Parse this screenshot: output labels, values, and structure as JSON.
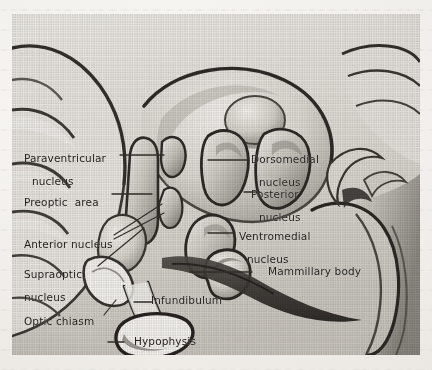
{
  "figure": {
    "kind": "anatomical-illustration",
    "medium": "grayscale halftone print scan"
  },
  "labels": {
    "paraventricular_nucleus": {
      "line1": "Paraventricular",
      "line2": "nucleus"
    },
    "preoptic_area": {
      "line1": "Preoptic  area"
    },
    "anterior_nucleus": {
      "line1": "Anterior nucleus"
    },
    "supraoptic_nucleus": {
      "line1": "Supraoptic",
      "line2": "nucleus"
    },
    "optic_chiasm": {
      "line1": "Optic chiasm"
    },
    "infundibulum": {
      "line1": "Infundibulum"
    },
    "hypophysis": {
      "line1": "Hypophysis"
    },
    "dorsomedial_nucleus": {
      "line1": "Dorsomedial",
      "line2": "nucleus"
    },
    "posterior_nucleus": {
      "line1": "Posterior",
      "line2": "nucleus"
    },
    "ventromedial_nucleus": {
      "line1": "Ventromedial",
      "line2": "nucleus"
    },
    "mammillary_body": {
      "line1": "Mammillary body"
    }
  },
  "colors": {
    "paper": "#f1efeb",
    "ink": "#23211e",
    "leader_line": "#3a3733",
    "plate_light": "#e9e6e1",
    "plate_mid": "#b9b4ad",
    "plate_dark": "#4a4641",
    "plate_darkest": "#272421"
  }
}
